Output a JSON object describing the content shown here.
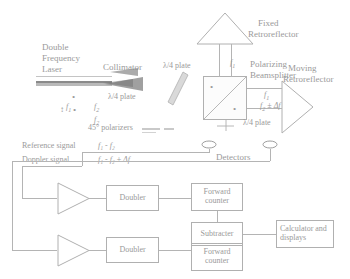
{
  "diagram": {
    "stroke_color": "#b0b0b0",
    "text_color": "#9a9a9a"
  },
  "source": {
    "laser_label_line1": "Double",
    "laser_label_line2": "Frequency",
    "laser_label_line3": "Laser",
    "collimator_label": "Collimator",
    "beam_freq_1": "f",
    "beam_freq_1_sub": "1",
    "beam_freq_2": "f",
    "beam_freq_2_sub": "2",
    "pol_marker_vertical": "↕",
    "pol_marker_dot": "•"
  },
  "optics": {
    "qwp_top_label": "λ/4 plate",
    "qwp_left_label": "λ/4 plate",
    "qwp_bottom_label": "λ/4 plate",
    "polarizers_label": "45° polarizers",
    "beamsplitter_label_line1": "Polarizing",
    "beamsplitter_label_line2": "Beamsplitter",
    "fixed_retro_line1": "Fixed",
    "fixed_retro_line2": "Retroreflector",
    "moving_retro_line1": "Moving",
    "moving_retro_line2": "Retroreflector",
    "arm_freq_fixed": "f",
    "arm_freq_fixed_sub": "1",
    "arm_freq_moving": "f",
    "arm_freq_moving_sub": "2",
    "arm_freq_moving_shift": " ± Δf"
  },
  "detection": {
    "detectors_label": "Detectors",
    "reference_signal_label": "Reference signal",
    "reference_signal_value": "f₁ - f₂",
    "doppler_signal_label": "Doppler signal",
    "doppler_signal_value": "f₁ - f₂ ± Δf"
  },
  "electronics": {
    "amplifier_top": "amplifier",
    "amplifier_bottom": "amplifier",
    "doubler_top": "Doubler",
    "doubler_bottom": "Doubler",
    "counter_top_line1": "Forward",
    "counter_top_line2": "counter",
    "counter_bottom_line1": "Forward",
    "counter_bottom_line2": "counter",
    "subtracter": "Subtracter",
    "calculator_line1": "Calculator and",
    "calculator_line2": "displays"
  }
}
